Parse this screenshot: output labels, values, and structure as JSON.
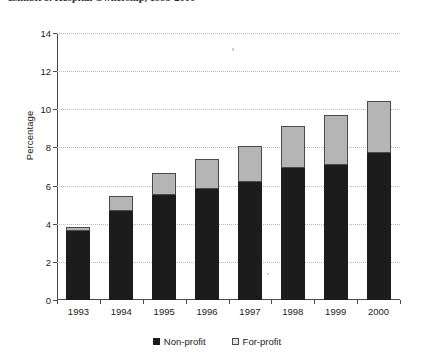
{
  "title": {
    "text": "Exhibit 3. Hospital Ownership, 1993-2000",
    "clipped": true
  },
  "legend": {
    "position": "bottom-center",
    "items": [
      {
        "label": "Non-profit",
        "key": "nonprofit",
        "color": "#1c1c1c",
        "marker": "filled-square"
      },
      {
        "label": "For-profit",
        "key": "forprofit",
        "color": "#e2e2e2",
        "marker": "open-square"
      }
    ]
  },
  "axes": {
    "ylabel": "Percentage",
    "xlabel": "",
    "yticks": [
      0,
      2,
      4,
      6,
      8,
      10,
      12,
      14
    ],
    "ytick_labels": [
      "0",
      "2",
      "4",
      "6",
      "8",
      "10",
      "12",
      "14"
    ],
    "ylim": [
      0,
      14
    ],
    "grid": "horizontal-dotted"
  },
  "chart_data": {
    "type": "bar",
    "stacked": true,
    "title": "Exhibit 3. Hospital Ownership, 1993-2000",
    "xlabel": "",
    "ylabel": "Percentage",
    "ylim": [
      0,
      14
    ],
    "yticks": [
      0,
      2,
      4,
      6,
      8,
      10,
      12,
      14
    ],
    "grid": true,
    "legend_position": "bottom-center",
    "categories": [
      "1993",
      "1994",
      "1995",
      "1996",
      "1997",
      "1998",
      "1999",
      "2000"
    ],
    "series": [
      {
        "name": "Non-profit",
        "color": "#1c1c1c",
        "values": [
          3.6,
          4.65,
          5.5,
          5.8,
          6.2,
          6.9,
          7.1,
          7.7
        ]
      },
      {
        "name": "For-profit",
        "color": "#b5b5b5",
        "values": [
          0.25,
          0.8,
          1.15,
          1.6,
          1.9,
          2.2,
          2.6,
          2.75
        ]
      }
    ],
    "totals": [
      3.85,
      5.45,
      6.65,
      7.4,
      8.1,
      9.1,
      9.7,
      10.45
    ]
  }
}
